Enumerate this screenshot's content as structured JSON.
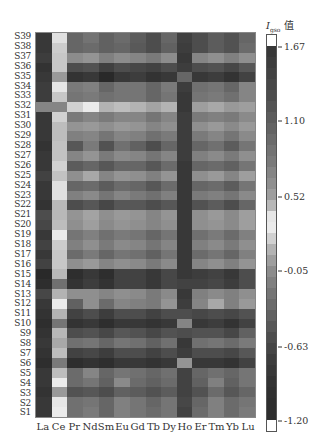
{
  "chart_data": {
    "type": "heatmap",
    "title": "",
    "colorbar_label": "I_gso 值",
    "colorbar_label_main": "I",
    "colorbar_label_sub": "gso",
    "colorbar_label_suffix": " 值",
    "xlabel": "",
    "ylabel": "",
    "columns": [
      "La",
      "Ce",
      "Pr",
      "Nd",
      "Sm",
      "Eu",
      "Gd",
      "Tb",
      "Dy",
      "Ho",
      "Er",
      "Tm",
      "Yb",
      "Lu"
    ],
    "rows": [
      "S39",
      "S38",
      "S37",
      "S36",
      "S35",
      "S34",
      "S33",
      "S32",
      "S31",
      "S30",
      "S29",
      "S28",
      "S27",
      "S26",
      "S25",
      "S24",
      "S23",
      "S22",
      "S21",
      "S20",
      "S19",
      "S18",
      "S17",
      "S16",
      "S15",
      "S14",
      "S13",
      "S12",
      "S11",
      "S10",
      "S9",
      "S8",
      "S7",
      "S6",
      "S5",
      "S4",
      "S3",
      "S2",
      "S1"
    ],
    "colorbar_ticks": [
      1.67,
      1.1,
      0.52,
      -0.05,
      -0.63,
      -1.2
    ],
    "colorbar_tick_labels": [
      "1.67",
      "1.10",
      "0.52",
      "-0.05",
      "-0.63",
      "-1.20"
    ],
    "value_range": [
      -1.2,
      1.67
    ],
    "note": "grayscale intensity values (0=black,1=white) estimated per cell",
    "intensity": [
      [
        0.22,
        0.88,
        0.4,
        0.45,
        0.38,
        0.42,
        0.36,
        0.3,
        0.4,
        0.25,
        0.3,
        0.36,
        0.32,
        0.4
      ],
      [
        0.22,
        0.8,
        0.4,
        0.42,
        0.38,
        0.4,
        0.35,
        0.3,
        0.38,
        0.24,
        0.3,
        0.36,
        0.32,
        0.42
      ],
      [
        0.24,
        0.78,
        0.55,
        0.58,
        0.5,
        0.55,
        0.52,
        0.48,
        0.55,
        0.22,
        0.52,
        0.56,
        0.5,
        0.56
      ],
      [
        0.2,
        0.78,
        0.3,
        0.32,
        0.25,
        0.3,
        0.28,
        0.26,
        0.3,
        0.24,
        0.3,
        0.32,
        0.28,
        0.34
      ],
      [
        0.22,
        0.6,
        0.2,
        0.22,
        0.16,
        0.22,
        0.24,
        0.2,
        0.22,
        0.4,
        0.22,
        0.24,
        0.2,
        0.26
      ],
      [
        0.24,
        0.9,
        0.48,
        0.5,
        0.4,
        0.46,
        0.46,
        0.4,
        0.48,
        0.24,
        0.44,
        0.46,
        0.4,
        0.52
      ],
      [
        0.24,
        0.78,
        0.46,
        0.48,
        0.44,
        0.46,
        0.46,
        0.4,
        0.46,
        0.22,
        0.46,
        0.48,
        0.44,
        0.52
      ],
      [
        0.52,
        0.52,
        0.82,
        0.92,
        0.7,
        0.74,
        0.7,
        0.64,
        0.7,
        0.22,
        0.62,
        0.66,
        0.6,
        0.62
      ],
      [
        0.22,
        0.82,
        0.48,
        0.52,
        0.48,
        0.52,
        0.52,
        0.46,
        0.52,
        0.24,
        0.48,
        0.5,
        0.48,
        0.54
      ],
      [
        0.22,
        0.74,
        0.58,
        0.6,
        0.56,
        0.6,
        0.58,
        0.52,
        0.56,
        0.24,
        0.56,
        0.6,
        0.54,
        0.6
      ],
      [
        0.22,
        0.74,
        0.5,
        0.52,
        0.46,
        0.52,
        0.5,
        0.44,
        0.48,
        0.24,
        0.48,
        0.52,
        0.46,
        0.54
      ],
      [
        0.2,
        0.76,
        0.34,
        0.48,
        0.32,
        0.44,
        0.38,
        0.3,
        0.4,
        0.24,
        0.4,
        0.44,
        0.36,
        0.46
      ],
      [
        0.22,
        0.76,
        0.52,
        0.58,
        0.48,
        0.54,
        0.52,
        0.46,
        0.52,
        0.24,
        0.5,
        0.54,
        0.48,
        0.56
      ],
      [
        0.22,
        0.82,
        0.36,
        0.4,
        0.34,
        0.4,
        0.4,
        0.34,
        0.42,
        0.22,
        0.4,
        0.42,
        0.38,
        0.46
      ],
      [
        0.26,
        0.76,
        0.56,
        0.66,
        0.52,
        0.58,
        0.56,
        0.5,
        0.58,
        0.22,
        0.56,
        0.6,
        0.52,
        0.62
      ],
      [
        0.22,
        0.88,
        0.4,
        0.42,
        0.36,
        0.42,
        0.4,
        0.34,
        0.42,
        0.22,
        0.4,
        0.42,
        0.36,
        0.46
      ],
      [
        0.22,
        0.88,
        0.5,
        0.54,
        0.46,
        0.52,
        0.48,
        0.44,
        0.5,
        0.22,
        0.48,
        0.5,
        0.46,
        0.54
      ],
      [
        0.2,
        0.72,
        0.3,
        0.34,
        0.28,
        0.34,
        0.34,
        0.3,
        0.34,
        0.22,
        0.32,
        0.36,
        0.3,
        0.4
      ],
      [
        0.3,
        0.72,
        0.58,
        0.64,
        0.56,
        0.6,
        0.58,
        0.52,
        0.58,
        0.22,
        0.56,
        0.6,
        0.54,
        0.62
      ],
      [
        0.28,
        0.74,
        0.56,
        0.62,
        0.54,
        0.58,
        0.56,
        0.52,
        0.56,
        0.22,
        0.56,
        0.58,
        0.54,
        0.62
      ],
      [
        0.22,
        0.92,
        0.46,
        0.5,
        0.44,
        0.48,
        0.46,
        0.4,
        0.46,
        0.22,
        0.44,
        0.48,
        0.42,
        0.5
      ],
      [
        0.26,
        0.8,
        0.5,
        0.56,
        0.48,
        0.54,
        0.52,
        0.46,
        0.52,
        0.22,
        0.5,
        0.54,
        0.48,
        0.56
      ],
      [
        0.22,
        0.78,
        0.42,
        0.48,
        0.4,
        0.46,
        0.44,
        0.38,
        0.46,
        0.22,
        0.42,
        0.46,
        0.4,
        0.5
      ],
      [
        0.26,
        0.78,
        0.56,
        0.6,
        0.52,
        0.56,
        0.54,
        0.48,
        0.54,
        0.22,
        0.52,
        0.56,
        0.5,
        0.58
      ],
      [
        0.16,
        0.72,
        0.18,
        0.22,
        0.18,
        0.26,
        0.26,
        0.22,
        0.28,
        0.22,
        0.24,
        0.26,
        0.22,
        0.3
      ],
      [
        0.18,
        0.44,
        0.2,
        0.24,
        0.2,
        0.26,
        0.26,
        0.22,
        0.28,
        0.26,
        0.26,
        0.28,
        0.24,
        0.3
      ],
      [
        0.28,
        0.7,
        0.56,
        0.56,
        0.52,
        0.56,
        0.54,
        0.48,
        0.54,
        0.22,
        0.5,
        0.54,
        0.5,
        0.56
      ],
      [
        0.22,
        0.92,
        0.38,
        0.56,
        0.42,
        0.52,
        0.5,
        0.48,
        0.58,
        0.24,
        0.52,
        0.66,
        0.5,
        0.6
      ],
      [
        0.2,
        0.7,
        0.26,
        0.3,
        0.24,
        0.3,
        0.3,
        0.26,
        0.3,
        0.3,
        0.28,
        0.3,
        0.28,
        0.32
      ],
      [
        0.18,
        0.46,
        0.2,
        0.22,
        0.18,
        0.22,
        0.22,
        0.2,
        0.22,
        0.52,
        0.22,
        0.24,
        0.2,
        0.26
      ],
      [
        0.2,
        0.72,
        0.3,
        0.32,
        0.28,
        0.34,
        0.32,
        0.28,
        0.32,
        0.3,
        0.32,
        0.32,
        0.28,
        0.38
      ],
      [
        0.22,
        0.66,
        0.44,
        0.46,
        0.4,
        0.46,
        0.44,
        0.38,
        0.44,
        0.22,
        0.44,
        0.46,
        0.42,
        0.48
      ],
      [
        0.2,
        0.74,
        0.26,
        0.28,
        0.24,
        0.3,
        0.3,
        0.26,
        0.3,
        0.24,
        0.3,
        0.3,
        0.28,
        0.34
      ],
      [
        0.18,
        0.48,
        0.18,
        0.2,
        0.18,
        0.22,
        0.22,
        0.2,
        0.22,
        0.58,
        0.22,
        0.22,
        0.2,
        0.26
      ],
      [
        0.22,
        0.74,
        0.42,
        0.52,
        0.4,
        0.46,
        0.44,
        0.4,
        0.44,
        0.26,
        0.4,
        0.44,
        0.4,
        0.46
      ],
      [
        0.22,
        0.92,
        0.42,
        0.46,
        0.38,
        0.54,
        0.42,
        0.38,
        0.42,
        0.26,
        0.38,
        0.5,
        0.38,
        0.46
      ],
      [
        0.2,
        0.6,
        0.32,
        0.34,
        0.3,
        0.38,
        0.36,
        0.32,
        0.36,
        0.26,
        0.32,
        0.42,
        0.34,
        0.4
      ],
      [
        0.22,
        0.9,
        0.44,
        0.46,
        0.4,
        0.5,
        0.46,
        0.4,
        0.46,
        0.28,
        0.4,
        0.5,
        0.42,
        0.46
      ],
      [
        0.22,
        0.92,
        0.44,
        0.48,
        0.4,
        0.5,
        0.46,
        0.42,
        0.46,
        0.26,
        0.42,
        0.5,
        0.42,
        0.48
      ]
    ],
    "colorbar_intensity_top_to_bottom": [
      1.0,
      0.22,
      0.24,
      0.26,
      0.28,
      0.3,
      0.33,
      0.36,
      0.39,
      0.42,
      0.45,
      0.48,
      0.52,
      0.56,
      0.62,
      0.72,
      0.9,
      0.92,
      0.82,
      0.7,
      0.62,
      0.55,
      0.5,
      0.46,
      0.42,
      0.38,
      0.34,
      0.3,
      0.27,
      0.24,
      0.22,
      0.2,
      0.19,
      0.18,
      0.18,
      1.0
    ]
  }
}
